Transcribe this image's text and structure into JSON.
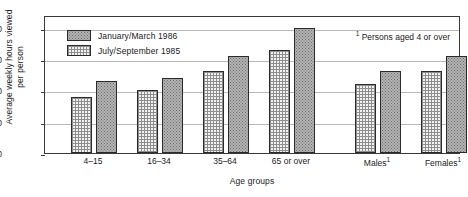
{
  "chart_data": {
    "type": "bar",
    "title": "",
    "xlabel": "Age groups",
    "ylabel": "Average weekly hours viewed\nper person",
    "categories": [
      "4–15",
      "16–34",
      "35–64",
      "65 or over",
      "Males¹",
      "Females¹"
    ],
    "series": [
      {
        "name": "July/September 1985",
        "fill": "cross-hatch",
        "values": [
          18,
          20,
          26,
          33,
          22,
          26
        ]
      },
      {
        "name": "January/March 1986",
        "fill": "stipple",
        "values": [
          23,
          24,
          31,
          40,
          26,
          31
        ]
      }
    ],
    "ylim": [
      0,
      44
    ],
    "yticks": [
      0,
      10,
      20,
      30,
      40
    ],
    "ytick_labels": [
      "0",
      "10",
      "20",
      "30",
      "40"
    ],
    "grid": true,
    "legend_position": "top-left",
    "annotations": [
      "¹ Persons aged 4 or over"
    ]
  },
  "legend": {
    "items": [
      {
        "label": "January/March 1986"
      },
      {
        "label": "July/September 1985"
      }
    ]
  },
  "footnote": {
    "marker": "1",
    "text": " Persons aged 4 or over"
  },
  "colors": {
    "axis": "#3a3a3a",
    "grid": "#b9b9b9",
    "bar_outline": "#2b2b2b",
    "stipple_fill": "#b3b3b3",
    "hatch_fill": "#f2f2f2",
    "background": "#ffffff"
  }
}
